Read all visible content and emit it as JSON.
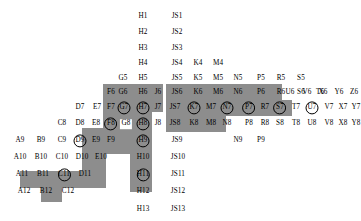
{
  "diagram": {
    "shade_color": "#8d8d8d",
    "background_color": "#ffffff",
    "text_color": "#000000"
  },
  "shaded_regions": [
    {
      "name": "region-a11-d11",
      "x": 20,
      "y": 171,
      "w": 62,
      "h": 17
    },
    {
      "name": "region-b12",
      "x": 41,
      "y": 188,
      "w": 21,
      "h": 14
    },
    {
      "name": "region-d10-d11",
      "x": 82,
      "y": 154,
      "w": 24,
      "h": 34
    },
    {
      "name": "region-d9-f9",
      "x": 82,
      "y": 128,
      "w": 60,
      "h": 26
    },
    {
      "name": "region-d8-f8",
      "x": 103,
      "y": 112,
      "w": 39,
      "h": 16
    },
    {
      "name": "region-f7-h7",
      "x": 103,
      "y": 84,
      "w": 60,
      "h": 28
    },
    {
      "name": "region-h8-h12",
      "x": 130,
      "y": 112,
      "w": 22,
      "h": 80
    },
    {
      "name": "region-js6-t6",
      "x": 166,
      "y": 84,
      "w": 116,
      "h": 16
    },
    {
      "name": "region-js7-u7",
      "x": 166,
      "y": 100,
      "w": 126,
      "h": 16
    },
    {
      "name": "region-js8-n8",
      "x": 166,
      "y": 116,
      "w": 60,
      "h": 16
    }
  ],
  "cells": [
    {
      "label": "H1",
      "x": 143,
      "y": 17,
      "ring": false,
      "white": false
    },
    {
      "label": "JS1",
      "x": 177,
      "y": 17,
      "ring": false,
      "white": false
    },
    {
      "label": "H2",
      "x": 143,
      "y": 33,
      "ring": false,
      "white": false
    },
    {
      "label": "JS2",
      "x": 177,
      "y": 33,
      "ring": false,
      "white": false
    },
    {
      "label": "H3",
      "x": 143,
      "y": 49,
      "ring": false,
      "white": false
    },
    {
      "label": "JS3",
      "x": 177,
      "y": 49,
      "ring": false,
      "white": false
    },
    {
      "label": "H4",
      "x": 143,
      "y": 64,
      "ring": false,
      "white": false
    },
    {
      "label": "JS4",
      "x": 177,
      "y": 64,
      "ring": false,
      "white": false
    },
    {
      "label": "K4",
      "x": 198,
      "y": 64,
      "ring": false,
      "white": false
    },
    {
      "label": "M4",
      "x": 218,
      "y": 64,
      "ring": false,
      "white": false
    },
    {
      "label": "G5",
      "x": 123,
      "y": 79,
      "ring": false,
      "white": false
    },
    {
      "label": "H5",
      "x": 143,
      "y": 79,
      "ring": false,
      "white": false
    },
    {
      "label": "JS5",
      "x": 177,
      "y": 79,
      "ring": false,
      "white": false
    },
    {
      "label": "K5",
      "x": 198,
      "y": 79,
      "ring": false,
      "white": false
    },
    {
      "label": "M5",
      "x": 218,
      "y": 79,
      "ring": false,
      "white": false
    },
    {
      "label": "N5",
      "x": 238,
      "y": 79,
      "ring": false,
      "white": false
    },
    {
      "label": "P5",
      "x": 261,
      "y": 79,
      "ring": false,
      "white": false
    },
    {
      "label": "R5",
      "x": 281,
      "y": 79,
      "ring": false,
      "white": false
    },
    {
      "label": "S5",
      "x": 301,
      "y": 79,
      "ring": false,
      "white": false
    },
    {
      "label": "F6",
      "x": 111,
      "y": 93,
      "ring": false,
      "white": false
    },
    {
      "label": "G6",
      "x": 123,
      "y": 93,
      "ring": false,
      "white": false
    },
    {
      "label": "H6",
      "x": 143,
      "y": 93,
      "ring": false,
      "white": false
    },
    {
      "label": "J6",
      "x": 158,
      "y": 93,
      "ring": false,
      "white": false
    },
    {
      "label": "JS6",
      "x": 177,
      "y": 93,
      "ring": false,
      "white": false
    },
    {
      "label": "K6",
      "x": 198,
      "y": 93,
      "ring": false,
      "white": false
    },
    {
      "label": "M6",
      "x": 218,
      "y": 93,
      "ring": false,
      "white": false
    },
    {
      "label": "N6",
      "x": 238,
      "y": 93,
      "ring": false,
      "white": false
    },
    {
      "label": "P6",
      "x": 261,
      "y": 93,
      "ring": false,
      "white": false
    },
    {
      "label": "R6",
      "x": 281,
      "y": 93,
      "ring": false,
      "white": false
    },
    {
      "label": "S6",
      "x": 301,
      "y": 93,
      "ring": false,
      "white": false
    },
    {
      "label": "T6",
      "x": 320,
      "y": 93,
      "ring": false,
      "white": false
    },
    {
      "label": "U6",
      "x": 290,
      "y": 93,
      "ring": false,
      "white": false
    },
    {
      "label": "V6",
      "x": 307,
      "y": 93,
      "ring": false,
      "white": false
    },
    {
      "label": "X6",
      "x": 323,
      "y": 93,
      "ring": false,
      "white": false
    },
    {
      "label": "Y6",
      "x": 339,
      "y": 93,
      "ring": false,
      "white": false
    },
    {
      "label": "Z6",
      "x": 354,
      "y": 93,
      "ring": false,
      "white": false
    },
    {
      "label": "D7",
      "x": 80,
      "y": 108,
      "ring": false,
      "white": false
    },
    {
      "label": "E7",
      "x": 97,
      "y": 108,
      "ring": false,
      "white": false
    },
    {
      "label": "F7",
      "x": 111,
      "y": 108,
      "ring": false,
      "white": false
    },
    {
      "label": "G7",
      "x": 124,
      "y": 108,
      "ring": true,
      "white": false
    },
    {
      "label": "H7",
      "x": 143,
      "y": 108,
      "ring": true,
      "white": false
    },
    {
      "label": "J7",
      "x": 158,
      "y": 108,
      "ring": false,
      "white": false
    },
    {
      "label": "JS7",
      "x": 175,
      "y": 108,
      "ring": false,
      "white": false
    },
    {
      "label": "K7",
      "x": 194,
      "y": 108,
      "ring": true,
      "white": false
    },
    {
      "label": "M7",
      "x": 211,
      "y": 108,
      "ring": false,
      "white": false
    },
    {
      "label": "N7",
      "x": 227,
      "y": 108,
      "ring": true,
      "white": false
    },
    {
      "label": "P7",
      "x": 249,
      "y": 108,
      "ring": true,
      "white": false
    },
    {
      "label": "R7",
      "x": 265,
      "y": 108,
      "ring": false,
      "white": false
    },
    {
      "label": "S7",
      "x": 280,
      "y": 108,
      "ring": true,
      "white": false
    },
    {
      "label": "T7",
      "x": 296,
      "y": 108,
      "ring": false,
      "white": false
    },
    {
      "label": "U7",
      "x": 312,
      "y": 108,
      "ring": true,
      "white": false
    },
    {
      "label": "V7",
      "x": 329,
      "y": 108,
      "ring": false,
      "white": false
    },
    {
      "label": "X7",
      "x": 343,
      "y": 108,
      "ring": false,
      "white": false
    },
    {
      "label": "Y7",
      "x": 356,
      "y": 108,
      "ring": false,
      "white": false
    },
    {
      "label": "Z7",
      "x": 368,
      "y": 108,
      "ring": false,
      "white": false
    },
    {
      "label": "C8",
      "x": 62,
      "y": 124,
      "ring": false,
      "white": false
    },
    {
      "label": "D8",
      "x": 80,
      "y": 124,
      "ring": false,
      "white": false
    },
    {
      "label": "E8",
      "x": 96,
      "y": 124,
      "ring": false,
      "white": false
    },
    {
      "label": "F8",
      "x": 111,
      "y": 124,
      "ring": true,
      "white": false
    },
    {
      "label": "G8",
      "x": 126,
      "y": 124,
      "ring": false,
      "white": true
    },
    {
      "label": "H8",
      "x": 143,
      "y": 124,
      "ring": true,
      "white": false
    },
    {
      "label": "J8",
      "x": 158,
      "y": 124,
      "ring": false,
      "white": false
    },
    {
      "label": "JS8",
      "x": 175,
      "y": 124,
      "ring": false,
      "white": false
    },
    {
      "label": "K8",
      "x": 194,
      "y": 124,
      "ring": false,
      "white": false
    },
    {
      "label": "M8",
      "x": 211,
      "y": 124,
      "ring": false,
      "white": false
    },
    {
      "label": "N8",
      "x": 227,
      "y": 124,
      "ring": false,
      "white": false
    },
    {
      "label": "P8",
      "x": 249,
      "y": 124,
      "ring": false,
      "white": false
    },
    {
      "label": "R8",
      "x": 265,
      "y": 124,
      "ring": false,
      "white": false
    },
    {
      "label": "S8",
      "x": 280,
      "y": 124,
      "ring": false,
      "white": false
    },
    {
      "label": "T8",
      "x": 296,
      "y": 124,
      "ring": false,
      "white": false
    },
    {
      "label": "U8",
      "x": 312,
      "y": 124,
      "ring": false,
      "white": false
    },
    {
      "label": "V8",
      "x": 329,
      "y": 124,
      "ring": false,
      "white": false
    },
    {
      "label": "X8",
      "x": 343,
      "y": 124,
      "ring": false,
      "white": false
    },
    {
      "label": "Y8",
      "x": 356,
      "y": 124,
      "ring": false,
      "white": false
    },
    {
      "label": "Z8",
      "x": 368,
      "y": 124,
      "ring": false,
      "white": false
    },
    {
      "label": "A9",
      "x": 20,
      "y": 141,
      "ring": false,
      "white": false
    },
    {
      "label": "B9",
      "x": 41,
      "y": 141,
      "ring": false,
      "white": false
    },
    {
      "label": "C9",
      "x": 62,
      "y": 141,
      "ring": false,
      "white": false
    },
    {
      "label": "D9",
      "x": 80,
      "y": 141,
      "ring": true,
      "white": false
    },
    {
      "label": "E9",
      "x": 96,
      "y": 141,
      "ring": false,
      "white": false
    },
    {
      "label": "F9",
      "x": 111,
      "y": 141,
      "ring": false,
      "white": false
    },
    {
      "label": "H9",
      "x": 143,
      "y": 141,
      "ring": true,
      "white": false
    },
    {
      "label": "JS9",
      "x": 177,
      "y": 141,
      "ring": false,
      "white": false
    },
    {
      "label": "N9",
      "x": 238,
      "y": 141,
      "ring": false,
      "white": false
    },
    {
      "label": "P9",
      "x": 261,
      "y": 141,
      "ring": false,
      "white": false
    },
    {
      "label": "A10",
      "x": 20,
      "y": 158,
      "ring": false,
      "white": false
    },
    {
      "label": "B10",
      "x": 41,
      "y": 158,
      "ring": false,
      "white": false
    },
    {
      "label": "C10",
      "x": 62,
      "y": 158,
      "ring": false,
      "white": false
    },
    {
      "label": "D10",
      "x": 82,
      "y": 158,
      "ring": false,
      "white": false
    },
    {
      "label": "E10",
      "x": 101,
      "y": 158,
      "ring": false,
      "white": false
    },
    {
      "label": "H10",
      "x": 143,
      "y": 158,
      "ring": false,
      "white": false
    },
    {
      "label": "JS10",
      "x": 178,
      "y": 158,
      "ring": false,
      "white": false
    },
    {
      "label": "A11",
      "x": 22,
      "y": 175,
      "ring": false,
      "white": false
    },
    {
      "label": "B11",
      "x": 43,
      "y": 175,
      "ring": false,
      "white": false
    },
    {
      "label": "C11",
      "x": 64,
      "y": 175,
      "ring": true,
      "white": false
    },
    {
      "label": "D11",
      "x": 85,
      "y": 175,
      "ring": false,
      "white": false
    },
    {
      "label": "H11",
      "x": 143,
      "y": 175,
      "ring": true,
      "white": false
    },
    {
      "label": "JS11",
      "x": 178,
      "y": 175,
      "ring": false,
      "white": false
    },
    {
      "label": "A12",
      "x": 24,
      "y": 192,
      "ring": false,
      "white": false
    },
    {
      "label": "B12",
      "x": 46,
      "y": 192,
      "ring": false,
      "white": false
    },
    {
      "label": "C12",
      "x": 68,
      "y": 192,
      "ring": false,
      "white": false
    },
    {
      "label": "H12",
      "x": 143,
      "y": 192,
      "ring": false,
      "white": false
    },
    {
      "label": "JS12",
      "x": 178,
      "y": 192,
      "ring": false,
      "white": false
    },
    {
      "label": "H13",
      "x": 143,
      "y": 210,
      "ring": false,
      "white": false
    },
    {
      "label": "JS13",
      "x": 178,
      "y": 210,
      "ring": false,
      "white": false
    }
  ]
}
